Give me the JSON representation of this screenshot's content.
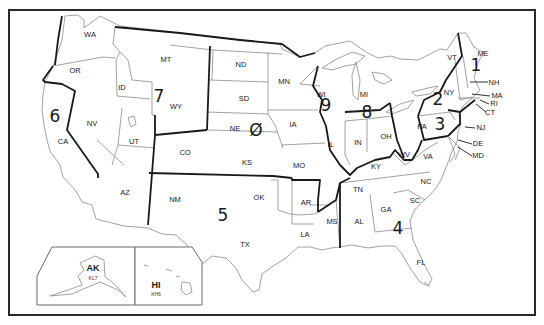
{
  "map": {
    "title": "US Amateur Radio Call Districts",
    "states": [
      {
        "abbr": "WA",
        "x": 90,
        "y": 35
      },
      {
        "abbr": "OR",
        "x": 75,
        "y": 71
      },
      {
        "abbr": "CA",
        "x": 63,
        "y": 142
      },
      {
        "abbr": "NV",
        "x": 92,
        "y": 124
      },
      {
        "abbr": "ID",
        "x": 122,
        "y": 88
      },
      {
        "abbr": "MT",
        "x": 166,
        "y": 60
      },
      {
        "abbr": "WY",
        "x": 176,
        "y": 107
      },
      {
        "abbr": "UT",
        "x": 134,
        "y": 142
      },
      {
        "abbr": "CO",
        "x": 185,
        "y": 153
      },
      {
        "abbr": "AZ",
        "x": 125,
        "y": 193
      },
      {
        "abbr": "NM",
        "x": 175,
        "y": 200
      },
      {
        "abbr": "ND",
        "x": 241,
        "y": 65
      },
      {
        "abbr": "SD",
        "x": 244,
        "y": 99
      },
      {
        "abbr": "NE",
        "x": 235,
        "y": 129
      },
      {
        "abbr": "KS",
        "x": 247,
        "y": 163
      },
      {
        "abbr": "OK",
        "x": 259,
        "y": 198
      },
      {
        "abbr": "TX",
        "x": 245,
        "y": 245
      },
      {
        "abbr": "MN",
        "x": 284,
        "y": 82
      },
      {
        "abbr": "IA",
        "x": 293,
        "y": 125
      },
      {
        "abbr": "MO",
        "x": 299,
        "y": 166
      },
      {
        "abbr": "AR",
        "x": 306,
        "y": 203
      },
      {
        "abbr": "LA",
        "x": 305,
        "y": 235
      },
      {
        "abbr": "WI",
        "x": 321,
        "y": 95
      },
      {
        "abbr": "IL",
        "x": 331,
        "y": 145
      },
      {
        "abbr": "MI",
        "x": 364,
        "y": 95
      },
      {
        "abbr": "IN",
        "x": 358,
        "y": 143
      },
      {
        "abbr": "OH",
        "x": 386,
        "y": 137
      },
      {
        "abbr": "KY",
        "x": 376,
        "y": 167
      },
      {
        "abbr": "TN",
        "x": 358,
        "y": 190
      },
      {
        "abbr": "MS",
        "x": 332,
        "y": 222
      },
      {
        "abbr": "AL",
        "x": 359,
        "y": 222
      },
      {
        "abbr": "GA",
        "x": 386,
        "y": 210
      },
      {
        "abbr": "FL",
        "x": 421,
        "y": 263
      },
      {
        "abbr": "SC",
        "x": 415,
        "y": 201
      },
      {
        "abbr": "NC",
        "x": 426,
        "y": 182
      },
      {
        "abbr": "VA",
        "x": 428,
        "y": 157
      },
      {
        "abbr": "WV",
        "x": 404,
        "y": 155
      },
      {
        "abbr": "PA",
        "x": 422,
        "y": 127
      },
      {
        "abbr": "NY",
        "x": 449,
        "y": 93
      },
      {
        "abbr": "VT",
        "x": 452,
        "y": 58
      },
      {
        "abbr": "ME",
        "x": 483,
        "y": 54
      }
    ],
    "callout_states": [
      {
        "abbr": "NH",
        "x": 494,
        "y": 83,
        "lx1": 470,
        "ly1": 82,
        "lx2": 488,
        "ly2": 82
      },
      {
        "abbr": "MA",
        "x": 497,
        "y": 96,
        "lx1": 472,
        "ly1": 94,
        "lx2": 490,
        "ly2": 96
      },
      {
        "abbr": "RI",
        "x": 494,
        "y": 104,
        "lx1": 480,
        "ly1": 100,
        "lx2": 489,
        "ly2": 104
      },
      {
        "abbr": "CT",
        "x": 490,
        "y": 113,
        "lx1": 476,
        "ly1": 104,
        "lx2": 486,
        "ly2": 112
      },
      {
        "abbr": "NJ",
        "x": 481,
        "y": 128,
        "lx1": 465,
        "ly1": 127,
        "lx2": 475,
        "ly2": 128
      },
      {
        "abbr": "DE",
        "x": 478,
        "y": 144,
        "lx1": 458,
        "ly1": 140,
        "lx2": 472,
        "ly2": 144
      },
      {
        "abbr": "MD",
        "x": 478,
        "y": 156,
        "lx1": 458,
        "ly1": 147,
        "lx2": 472,
        "ly2": 156
      }
    ],
    "districts": [
      {
        "number": "1",
        "x": 476,
        "y": 66
      },
      {
        "number": "2",
        "x": 438,
        "y": 100
      },
      {
        "number": "3",
        "x": 440,
        "y": 125
      },
      {
        "number": "4",
        "x": 398,
        "y": 229
      },
      {
        "number": "5",
        "x": 223,
        "y": 216
      },
      {
        "number": "6",
        "x": 55,
        "y": 117
      },
      {
        "number": "7",
        "x": 159,
        "y": 97
      },
      {
        "number": "8",
        "x": 367,
        "y": 113
      },
      {
        "number": "9",
        "x": 326,
        "y": 106
      },
      {
        "number": "Ø",
        "x": 256,
        "y": 131
      }
    ],
    "insets": {
      "alaska": {
        "abbr": "AK",
        "call": "KL7"
      },
      "hawaii": {
        "abbr": "HI",
        "call": "KH6"
      }
    }
  }
}
